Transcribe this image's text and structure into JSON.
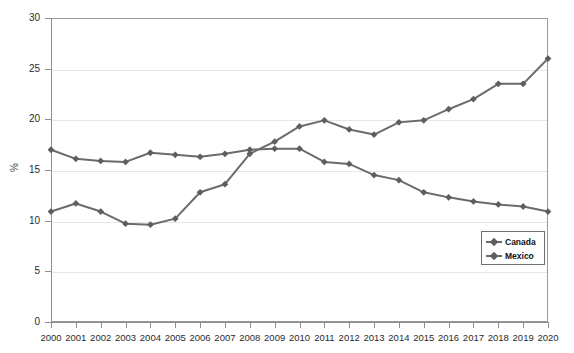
{
  "chart_data": {
    "type": "line",
    "title": "",
    "xlabel": "",
    "ylabel": "%",
    "xlim": [
      2000,
      2020
    ],
    "ylim": [
      0,
      30
    ],
    "ytick_step": 5,
    "yticks": [
      0,
      5,
      10,
      15,
      20,
      25,
      30
    ],
    "grid": true,
    "legend_position": "inner-right",
    "categories": [
      2000,
      2001,
      2002,
      2003,
      2004,
      2005,
      2006,
      2007,
      2008,
      2009,
      2010,
      2011,
      2012,
      2013,
      2014,
      2015,
      2016,
      2017,
      2018,
      2019,
      2020
    ],
    "series": [
      {
        "name": "Canada",
        "color": "#6b6b6b",
        "marker": "diamond",
        "values": [
          17.0,
          16.1,
          15.9,
          15.8,
          16.7,
          16.5,
          16.3,
          16.6,
          17.0,
          17.1,
          17.1,
          15.8,
          15.6,
          14.5,
          14.0,
          12.8,
          12.3,
          11.9,
          11.6,
          11.4,
          10.9
        ]
      },
      {
        "name": "Mexico",
        "color": "#6b6b6b",
        "marker": "diamond",
        "values": [
          10.9,
          11.7,
          10.9,
          9.7,
          9.6,
          10.2,
          12.8,
          13.6,
          16.6,
          17.8,
          19.3,
          19.9,
          19.0,
          18.5,
          19.7,
          19.9,
          21.0,
          22.0,
          23.5,
          23.5,
          26.0
        ]
      }
    ]
  },
  "axis": {
    "y_title": "%",
    "y_tick_labels": [
      "0",
      "5",
      "10",
      "15",
      "20",
      "25",
      "30"
    ],
    "x_tick_labels": [
      "2000",
      "2001",
      "2002",
      "2003",
      "2004",
      "2005",
      "2006",
      "2007",
      "2008",
      "2009",
      "2010",
      "2011",
      "2012",
      "2013",
      "2014",
      "2015",
      "2016",
      "2017",
      "2018",
      "2019",
      "2020"
    ]
  },
  "legend": {
    "items": [
      {
        "label": "Canada"
      },
      {
        "label": "Mexico"
      }
    ]
  },
  "colors": {
    "series_line": "#6b6b6b",
    "marker": "#5e5e5e",
    "gridline": "#e6e6e6",
    "axis": "#8e8e8e",
    "frame": "#9a9a9a",
    "text": "#2b2b2b"
  }
}
